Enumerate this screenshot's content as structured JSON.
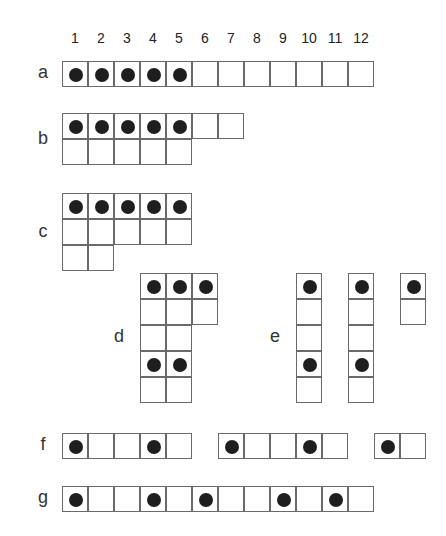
{
  "column_numbers": [
    "1",
    "2",
    "3",
    "4",
    "5",
    "6",
    "7",
    "8",
    "9",
    "10",
    "11",
    "12"
  ],
  "cell_size": 26,
  "origin_x": 62,
  "dot_color": "#1e1e1e",
  "grids": [
    {
      "label": "a",
      "label_x": 33,
      "label_y": 62,
      "blocks": [
        {
          "x": 62,
          "y": 61,
          "rows": [
            [
              1,
              1,
              1,
              1,
              1,
              0,
              0,
              0,
              0,
              0,
              0,
              0
            ]
          ]
        }
      ]
    },
    {
      "label": "b",
      "label_x": 33,
      "label_y": 128,
      "blocks": [
        {
          "x": 62,
          "y": 113,
          "rows": [
            [
              1,
              1,
              1,
              1,
              1,
              0,
              0
            ],
            [
              0,
              0,
              0,
              0,
              0
            ]
          ]
        }
      ]
    },
    {
      "label": "c",
      "label_x": 33,
      "label_y": 221,
      "blocks": [
        {
          "x": 62,
          "y": 193,
          "rows": [
            [
              1,
              1,
              1,
              1,
              1
            ],
            [
              0,
              0,
              0,
              0,
              0
            ],
            [
              0,
              0
            ]
          ]
        }
      ]
    },
    {
      "label": "d",
      "label_x": 109,
      "label_y": 326,
      "blocks": [
        {
          "x": 140,
          "y": 273,
          "rows": [
            [
              1,
              1,
              1
            ],
            [
              0,
              0,
              0
            ],
            [
              0,
              0
            ],
            [
              1,
              1
            ],
            [
              0,
              0
            ]
          ]
        }
      ]
    },
    {
      "label": "e",
      "label_x": 265,
      "label_y": 326,
      "blocks": [
        {
          "x": 296,
          "y": 273,
          "rows": [
            [
              1
            ],
            [
              0
            ],
            [
              0
            ],
            [
              1
            ],
            [
              0
            ]
          ]
        },
        {
          "x": 348,
          "y": 273,
          "rows": [
            [
              1
            ],
            [
              0
            ],
            [
              0
            ],
            [
              1
            ],
            [
              0
            ]
          ]
        },
        {
          "x": 400,
          "y": 273,
          "rows": [
            [
              1
            ],
            [
              0
            ]
          ]
        }
      ]
    },
    {
      "label": "f",
      "label_x": 33,
      "label_y": 434,
      "blocks": [
        {
          "x": 62,
          "y": 433,
          "rows": [
            [
              1,
              0,
              0,
              1,
              0
            ]
          ]
        },
        {
          "x": 218,
          "y": 433,
          "rows": [
            [
              1,
              0,
              0,
              1,
              0
            ]
          ]
        },
        {
          "x": 374,
          "y": 433,
          "rows": [
            [
              1,
              0
            ]
          ]
        }
      ]
    },
    {
      "label": "g",
      "label_x": 33,
      "label_y": 487,
      "blocks": [
        {
          "x": 62,
          "y": 486,
          "rows": [
            [
              1,
              0,
              0,
              1,
              0,
              1,
              0,
              0,
              1,
              0,
              1,
              0
            ]
          ]
        }
      ]
    }
  ]
}
